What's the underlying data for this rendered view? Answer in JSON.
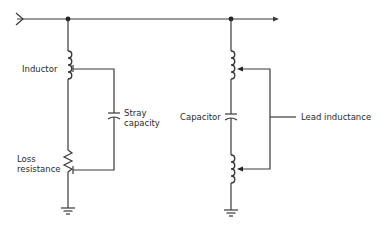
{
  "diagram": {
    "type": "circuit-schematic",
    "colors": {
      "line": "#3a3a3a",
      "text": "#2a2a2a",
      "background": "#ffffff"
    },
    "left_branch": {
      "inductor_label": "Inductor",
      "stray_label_line1": "Stray",
      "stray_label_line2": "capacity",
      "loss_label_line1": "Loss",
      "loss_label_line2": "resistance"
    },
    "right_branch": {
      "capacitor_label": "Capacitor",
      "lead_label": "Lead inductance"
    }
  }
}
